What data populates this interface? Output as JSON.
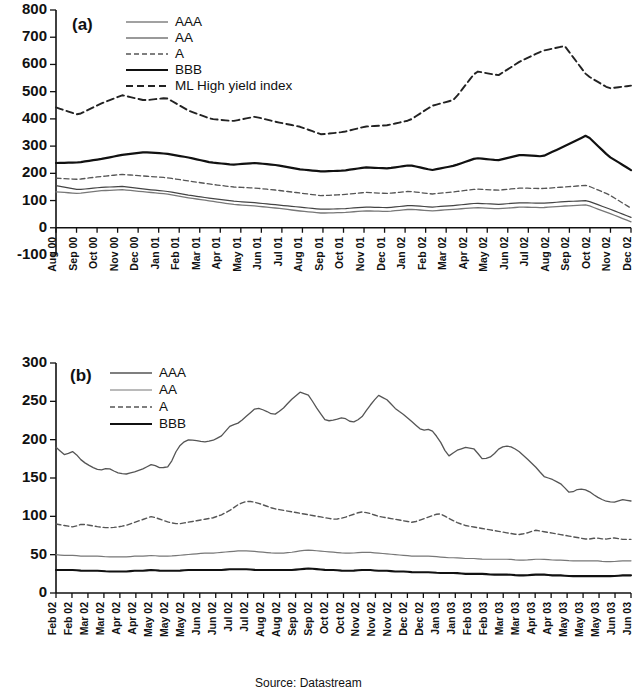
{
  "figure": {
    "source_note": "Source: Datastream"
  },
  "panel_a": {
    "label": "(a)",
    "legend": [
      {
        "name": "AAA",
        "style": "solid-thin",
        "color": "#444444",
        "width": 1.2,
        "dash": ""
      },
      {
        "name": "AA",
        "style": "solid-thin-gray",
        "color": "#777777",
        "width": 1.3,
        "dash": ""
      },
      {
        "name": "A",
        "style": "dashed-fine",
        "color": "#555555",
        "width": 1.3,
        "dash": "5,3"
      },
      {
        "name": "BBB",
        "style": "solid-thick",
        "color": "#111111",
        "width": 2.2,
        "dash": ""
      },
      {
        "name": "ML High yield index",
        "style": "dashed-bold",
        "color": "#222222",
        "width": 1.9,
        "dash": "7,4"
      }
    ]
  },
  "panel_b": {
    "label": "(b)",
    "legend": [
      {
        "name": "AAA",
        "style": "solid-thin",
        "color": "#555555",
        "width": 1.3,
        "dash": ""
      },
      {
        "name": "AA",
        "style": "solid-thin-gray",
        "color": "#777777",
        "width": 1.2,
        "dash": ""
      },
      {
        "name": "A",
        "style": "dashed-fine",
        "color": "#555555",
        "width": 1.4,
        "dash": "5,3"
      },
      {
        "name": "BBB",
        "style": "solid-thick",
        "color": "#111111",
        "width": 2.1,
        "dash": ""
      }
    ]
  },
  "chart_data": [
    {
      "type": "line",
      "title": "(a)",
      "xlabel": "",
      "ylabel": "",
      "ylim": [
        -100,
        800
      ],
      "yticks": [
        -100,
        0,
        100,
        200,
        300,
        400,
        500,
        600,
        700,
        800
      ],
      "grid": false,
      "legend_position": "top-left",
      "categories": [
        "Aug 00",
        "Sep 00",
        "Oct 00",
        "Nov 00",
        "Dec 00",
        "Jan 01",
        "Feb 01",
        "Mar 01",
        "Apr 01",
        "May 01",
        "Jun 01",
        "Jul 01",
        "Aug 01",
        "Sep 01",
        "Oct 01",
        "Nov 01",
        "Dec 01",
        "Jan 02",
        "Feb 02",
        "Mar 02",
        "Apr 02",
        "May 02",
        "Jun 02",
        "Jul 02",
        "Aug 02",
        "Sep 02",
        "Oct 02",
        "Nov 02",
        "Dec 02"
      ],
      "x": [
        0,
        1,
        2,
        3,
        4,
        5,
        6,
        7,
        8,
        9,
        10,
        11,
        12,
        13,
        14,
        15,
        16,
        17,
        18,
        19,
        20,
        21,
        22,
        23,
        24,
        25,
        26,
        27,
        28
      ],
      "series": [
        {
          "name": "ML High yield index",
          "values": [
            442,
            425,
            408,
            430,
            470,
            487,
            462,
            470,
            467,
            478,
            477,
            440,
            420,
            405,
            388,
            393,
            400,
            404,
            418,
            400,
            377,
            362,
            347,
            338,
            358,
            377,
            370,
            375,
            378,
            392,
            430,
            460,
            470,
            560,
            598,
            540,
            590,
            605,
            625,
            640,
            655,
            672,
            650,
            600,
            520,
            512,
            520,
            525
          ],
          "values_monthly": [
            442,
            415,
            455,
            487,
            468,
            477,
            430,
            400,
            392,
            408,
            388,
            372,
            343,
            352,
            372,
            377,
            395,
            448,
            470,
            575,
            560,
            612,
            650,
            668,
            560,
            512,
            522
          ]
        },
        {
          "name": "BBB",
          "values_monthly": [
            238,
            240,
            252,
            268,
            278,
            272,
            258,
            240,
            232,
            238,
            230,
            215,
            207,
            210,
            222,
            218,
            230,
            212,
            228,
            256,
            248,
            268,
            262,
            300,
            340,
            262,
            212
          ]
        },
        {
          "name": "A",
          "values_monthly": [
            182,
            178,
            188,
            196,
            190,
            184,
            172,
            160,
            150,
            146,
            138,
            128,
            118,
            122,
            130,
            126,
            134,
            124,
            132,
            142,
            138,
            146,
            144,
            150,
            156,
            122,
            72
          ]
        },
        {
          "name": "AAA",
          "values_monthly": [
            155,
            140,
            148,
            152,
            142,
            134,
            120,
            108,
            98,
            92,
            84,
            76,
            68,
            70,
            76,
            74,
            82,
            76,
            82,
            90,
            86,
            92,
            90,
            96,
            100,
            70,
            38
          ]
        },
        {
          "name": "AA",
          "values_monthly": [
            132,
            126,
            136,
            140,
            132,
            124,
            110,
            98,
            86,
            80,
            72,
            62,
            54,
            56,
            62,
            60,
            68,
            62,
            68,
            74,
            70,
            76,
            74,
            80,
            84,
            54,
            22
          ]
        }
      ]
    },
    {
      "type": "line",
      "title": "(b)",
      "xlabel": "",
      "ylabel": "",
      "ylim": [
        0,
        300
      ],
      "yticks": [
        0,
        50,
        100,
        150,
        200,
        250,
        300
      ],
      "grid": false,
      "legend_position": "top-left",
      "categories": [
        "Feb 02",
        "Feb 02",
        "Mar 02",
        "Mar 02",
        "Apr 02",
        "Apr 02",
        "May 02",
        "May 02",
        "May 02",
        "Jun 02",
        "Jun 02",
        "Jul 02",
        "Jul 02",
        "Aug 02",
        "Aug 02",
        "Sep 02",
        "Sep 02",
        "Oct 02",
        "Oct 02",
        "Nov 02",
        "Nov 02",
        "Nov 02",
        "Dec 02",
        "Dec 02",
        "Jan 03",
        "Jan 03",
        "Feb 03",
        "Feb 03",
        "Mar 03",
        "Mar 03",
        "Apr 03",
        "Apr 03",
        "May 03",
        "May 03",
        "May 03",
        "Jun 03",
        "Jun 03"
      ],
      "series": [
        {
          "name": "AAA",
          "values": [
            190,
            180,
            185,
            172,
            165,
            160,
            163,
            157,
            155,
            158,
            162,
            168,
            163,
            165,
            190,
            200,
            199,
            197,
            199,
            205,
            218,
            222,
            232,
            242,
            238,
            232,
            240,
            252,
            262,
            258,
            240,
            224,
            226,
            229,
            222,
            228,
            244,
            258,
            252,
            240,
            232,
            222,
            212,
            214,
            200,
            178,
            186,
            190,
            188,
            174,
            178,
            190,
            192,
            186,
            176,
            165,
            152,
            148,
            142,
            130,
            136,
            134,
            126,
            120,
            118,
            122,
            120
          ]
        },
        {
          "name": "A",
          "values": [
            90,
            88,
            86,
            90,
            88,
            86,
            85,
            86,
            88,
            92,
            96,
            100,
            96,
            92,
            90,
            92,
            94,
            96,
            98,
            102,
            108,
            116,
            120,
            118,
            114,
            110,
            108,
            106,
            104,
            102,
            100,
            98,
            96,
            98,
            102,
            106,
            104,
            100,
            98,
            96,
            94,
            92,
            96,
            100,
            104,
            98,
            92,
            88,
            86,
            84,
            82,
            80,
            78,
            76,
            78,
            82,
            80,
            78,
            76,
            74,
            72,
            70,
            72,
            70,
            72,
            70,
            70
          ]
        },
        {
          "name": "AA",
          "values": [
            50,
            49,
            49,
            48,
            48,
            48,
            47,
            47,
            47,
            48,
            48,
            49,
            48,
            48,
            49,
            50,
            51,
            52,
            52,
            53,
            54,
            55,
            55,
            54,
            53,
            52,
            52,
            53,
            55,
            56,
            55,
            54,
            53,
            52,
            52,
            53,
            53,
            52,
            51,
            50,
            49,
            48,
            48,
            48,
            47,
            46,
            46,
            45,
            45,
            44,
            44,
            44,
            44,
            43,
            43,
            44,
            44,
            43,
            43,
            42,
            42,
            42,
            42,
            41,
            41,
            42,
            42
          ]
        },
        {
          "name": "BBB",
          "values": [
            30,
            30,
            30,
            29,
            29,
            29,
            28,
            28,
            28,
            29,
            29,
            30,
            29,
            29,
            29,
            30,
            30,
            30,
            30,
            30,
            31,
            31,
            31,
            30,
            30,
            30,
            30,
            30,
            31,
            32,
            31,
            30,
            30,
            29,
            29,
            30,
            30,
            29,
            29,
            28,
            28,
            27,
            27,
            27,
            26,
            26,
            26,
            25,
            25,
            25,
            24,
            24,
            24,
            23,
            23,
            24,
            24,
            23,
            23,
            22,
            22,
            22,
            22,
            22,
            22,
            23,
            23
          ]
        }
      ]
    }
  ]
}
